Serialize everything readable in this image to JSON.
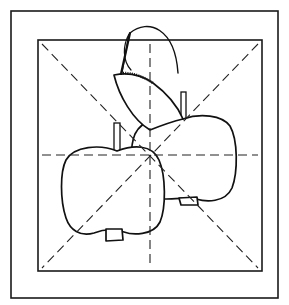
{
  "diagram": {
    "type": "folding-guide-illustration",
    "colors": {
      "line": "#111111",
      "background": "#ffffff"
    },
    "frames": {
      "outer": {
        "x": 11,
        "y": 11,
        "width": 267,
        "height": 287
      },
      "inner": {
        "x": 38,
        "y": 40,
        "width": 224,
        "height": 231
      }
    },
    "guides": {
      "center": {
        "x": 150,
        "y": 155
      },
      "lines": [
        "horizontal-dashed",
        "vertical-dashed",
        "diagonal-dashed-tl-br",
        "diagonal-dashed-tr-bl"
      ]
    },
    "objects": [
      "front-apple",
      "back-apple",
      "leaf",
      "curl-arc"
    ]
  }
}
